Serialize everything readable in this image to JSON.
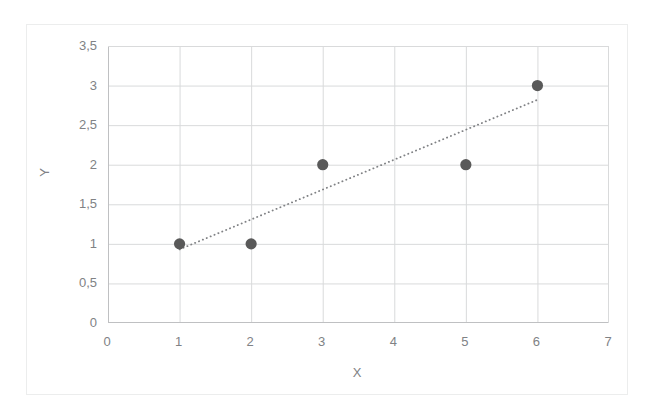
{
  "chart_data": {
    "type": "scatter",
    "title": "",
    "xlabel": "X",
    "ylabel": "Y",
    "xlim": [
      0,
      7
    ],
    "ylim": [
      0,
      3.5
    ],
    "grid": true,
    "legend": false,
    "decimal_separator": ",",
    "x_ticks": [
      0,
      1,
      2,
      3,
      4,
      5,
      6,
      7
    ],
    "x_tick_labels": [
      "0",
      "1",
      "2",
      "3",
      "4",
      "5",
      "6",
      "7"
    ],
    "y_ticks": [
      0,
      0.5,
      1,
      1.5,
      2,
      2.5,
      3,
      3.5
    ],
    "y_tick_labels": [
      "0",
      "0,5",
      "1",
      "1,5",
      "2",
      "2,5",
      "3",
      "3,5"
    ],
    "series": [
      {
        "name": "data-points",
        "style": "markers",
        "marker": "circle",
        "color": "#595959",
        "x": [
          1,
          2,
          3,
          5,
          6
        ],
        "y": [
          1,
          1,
          2,
          2,
          3
        ],
        "points": [
          {
            "x": 1,
            "y": 1
          },
          {
            "x": 2,
            "y": 1
          },
          {
            "x": 3,
            "y": 2
          },
          {
            "x": 5,
            "y": 2
          },
          {
            "x": 6,
            "y": 3
          }
        ]
      },
      {
        "name": "trendline",
        "style": "dotted-line",
        "color": "#808285",
        "x_start": 1,
        "y_start": 0.93,
        "x_end": 6,
        "y_end": 2.82
      }
    ],
    "colors": {
      "marker": "#595959",
      "trendline": "#808285",
      "gridline": "#d9dadb",
      "axis": "#bfc0c2",
      "text": "#808285",
      "frame": "#eceded",
      "background": "#ffffff"
    }
  }
}
